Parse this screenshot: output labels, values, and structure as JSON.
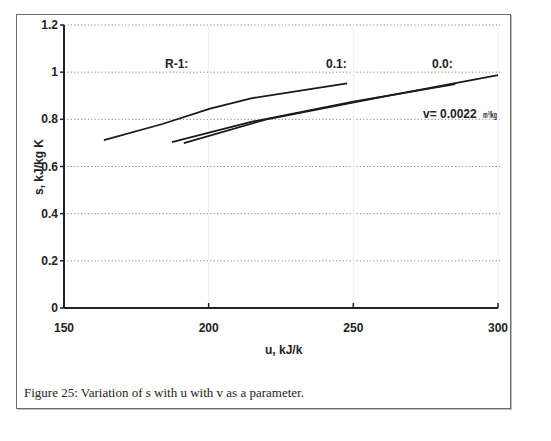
{
  "chart_data": {
    "type": "line",
    "title": "",
    "xlabel": "u, kJ/k",
    "ylabel": "s, kJ/kg K",
    "xlim": [
      150,
      300
    ],
    "ylim": [
      0,
      1.2
    ],
    "x_ticks": [
      "150",
      "200",
      "250",
      "300"
    ],
    "y_ticks": [
      "0",
      "0.2",
      "0.4",
      "0.6",
      "0.8",
      "1",
      "1.2"
    ],
    "grid": "horizontal dotted",
    "legend": "none (inline labels)",
    "series": [
      {
        "name": "R-1:",
        "x": [
          163.8,
          184.0,
          200.5,
          215.0,
          247.8
        ],
        "y": [
          0.712,
          0.78,
          0.845,
          0.89,
          0.953
        ]
      },
      {
        "name": "0.1:",
        "x": [
          187.3,
          215.0,
          250.0,
          285.2
        ],
        "y": [
          0.703,
          0.79,
          0.875,
          0.949
        ]
      },
      {
        "name": "0.0:",
        "x": [
          191.4,
          220.0,
          260.0,
          300.0
        ],
        "y": [
          0.699,
          0.8,
          0.895,
          0.987
        ]
      }
    ],
    "annotations": [
      "R-1:",
      "0.1:",
      "0.0:",
      "v= 0.0022 m3/kg"
    ]
  },
  "labels": {
    "r12": "R-1:",
    "v012": "0.1:",
    "v003": "0.0:",
    "v00022": "v= 0.0022",
    "v_unit": "m³/kg"
  },
  "caption": "Figure 25: Variation of s with u with v as a parameter."
}
